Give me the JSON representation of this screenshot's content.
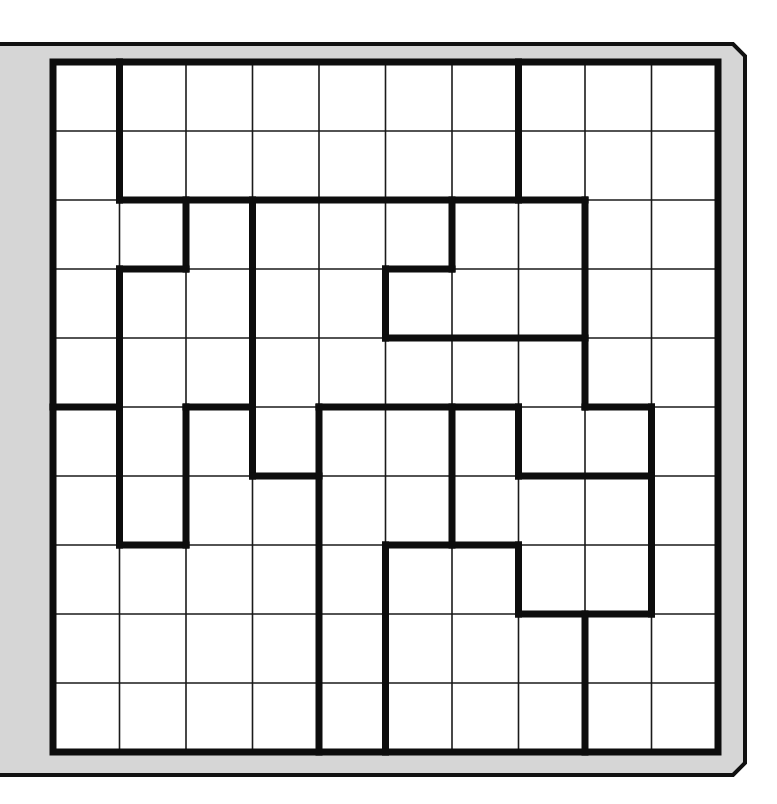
{
  "puzzle": {
    "type": "region-division-grid",
    "rows": 10,
    "cols": 10,
    "colors": {
      "background": "#ffffff",
      "frame_fill": "#d6d6d6",
      "frame_stroke": "#111111",
      "cell_fill": "#ffffff",
      "thin_line": "#1a1a1a",
      "thick_line": "#0d0d0d"
    },
    "thick_segments": [
      {
        "dir": "v",
        "at": 1,
        "from": 0,
        "to": 2
      },
      {
        "dir": "h",
        "at": 2,
        "from": 1,
        "to": 8
      },
      {
        "dir": "v",
        "at": 7,
        "from": 0,
        "to": 2
      },
      {
        "dir": "v",
        "at": 2,
        "from": 2,
        "to": 3
      },
      {
        "dir": "h",
        "at": 3,
        "from": 1,
        "to": 2
      },
      {
        "dir": "v",
        "at": 1,
        "from": 3,
        "to": 7
      },
      {
        "dir": "h",
        "at": 7,
        "from": 1,
        "to": 2
      },
      {
        "dir": "v",
        "at": 2,
        "from": 5,
        "to": 7
      },
      {
        "dir": "h",
        "at": 5,
        "from": 2,
        "to": 3
      },
      {
        "dir": "h",
        "at": 5,
        "from": 0,
        "to": 1
      },
      {
        "dir": "v",
        "at": 3,
        "from": 2,
        "to": 6
      },
      {
        "dir": "h",
        "at": 6,
        "from": 3,
        "to": 4
      },
      {
        "dir": "v",
        "at": 4,
        "from": 5,
        "to": 10
      },
      {
        "dir": "h",
        "at": 5,
        "from": 4,
        "to": 7
      },
      {
        "dir": "v",
        "at": 6,
        "from": 5,
        "to": 7
      },
      {
        "dir": "v",
        "at": 6,
        "from": 2,
        "to": 3
      },
      {
        "dir": "h",
        "at": 3,
        "from": 5,
        "to": 6
      },
      {
        "dir": "v",
        "at": 5,
        "from": 3,
        "to": 4
      },
      {
        "dir": "h",
        "at": 4,
        "from": 5,
        "to": 8
      },
      {
        "dir": "v",
        "at": 8,
        "from": 2,
        "to": 5
      },
      {
        "dir": "h",
        "at": 5,
        "from": 8,
        "to": 9
      },
      {
        "dir": "v",
        "at": 9,
        "from": 5,
        "to": 8
      },
      {
        "dir": "v",
        "at": 7,
        "from": 5,
        "to": 6
      },
      {
        "dir": "h",
        "at": 6,
        "from": 7,
        "to": 9
      },
      {
        "dir": "h",
        "at": 7,
        "from": 5,
        "to": 7
      },
      {
        "dir": "v",
        "at": 5,
        "from": 7,
        "to": 10
      },
      {
        "dir": "v",
        "at": 7,
        "from": 7,
        "to": 8
      },
      {
        "dir": "h",
        "at": 8,
        "from": 7,
        "to": 9
      },
      {
        "dir": "v",
        "at": 8,
        "from": 8,
        "to": 10
      }
    ]
  }
}
